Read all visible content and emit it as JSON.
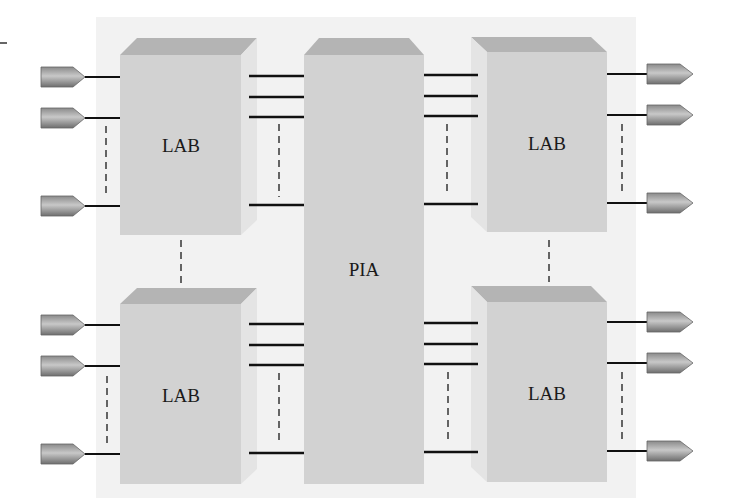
{
  "diagram": {
    "type": "block-architecture",
    "colors": {
      "panel": "#f2f2f2",
      "block_front": "#d2d2d2",
      "block_top": "#b4b4b4",
      "block_side": "#e4e4e4",
      "wire": "#111111",
      "dash": "#555555",
      "pin_dark": "#7a7a7a",
      "pin_light": "#c8c8c8",
      "text": "#1a1a1a"
    },
    "center_block": {
      "label": "PIA"
    },
    "blocks": [
      {
        "id": "lab-top-left",
        "label": "LAB"
      },
      {
        "id": "lab-top-right",
        "label": "LAB"
      },
      {
        "id": "lab-bottom-left",
        "label": "LAB"
      },
      {
        "id": "lab-bottom-right",
        "label": "LAB"
      }
    ],
    "io_pins": {
      "left_per_lab": 3,
      "right_per_lab": 3,
      "ellipsis_between": true
    },
    "interconnect": {
      "lines_per_lab_to_pia": 4,
      "ellipsis_between": true
    }
  }
}
